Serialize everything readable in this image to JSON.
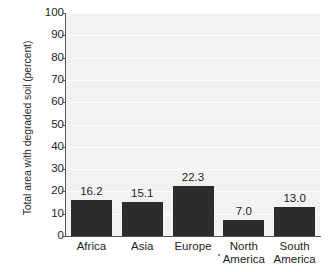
{
  "chart_data": {
    "type": "bar",
    "title": "",
    "subtitle": "",
    "xlabel": "",
    "ylabel": "Total area with degraded soil (percent)",
    "ylim": [
      0,
      100
    ],
    "ytick_step": 10,
    "yticks": [
      "100",
      "90",
      "80",
      "70",
      "60",
      "50",
      "40",
      "30",
      "20",
      "10",
      "0"
    ],
    "grid": true,
    "legend": false,
    "categories": [
      "Africa",
      "Asia",
      "Europe",
      "North America",
      "South America"
    ],
    "category_lines": [
      [
        "Africa"
      ],
      [
        "Asia"
      ],
      [
        "Europe"
      ],
      [
        "North",
        "America"
      ],
      [
        "South",
        "America"
      ]
    ],
    "values": [
      16.2,
      15.1,
      22.3,
      7.0,
      13.0
    ],
    "value_labels": [
      "16.2",
      "15.1",
      "22.3",
      "7.0",
      "13.0"
    ],
    "colors": {
      "bar": "#2c2c2c",
      "plot_background": "#f2f2f2",
      "gridline": "#ffffff",
      "axis": "#555555",
      "text": "#1e1e1e"
    }
  }
}
